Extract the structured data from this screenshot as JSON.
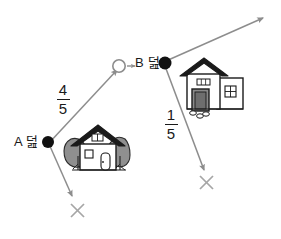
{
  "diagram": {
    "nodes": [
      {
        "id": "a",
        "label": "A 덢",
        "marker": "filled-dot"
      },
      {
        "id": "b",
        "label": "B 덢",
        "marker": "filled-dot"
      },
      {
        "id": "target",
        "label": "",
        "marker": "hollow-circle"
      }
    ],
    "fractions": [
      {
        "id": "left",
        "numerator": "4",
        "denominator": "5"
      },
      {
        "id": "right",
        "numerator": "1",
        "denominator": "5"
      }
    ],
    "marks": [
      {
        "id": "x-left",
        "glyph": "✕"
      },
      {
        "id": "x-right",
        "glyph": "✕"
      }
    ],
    "houses": [
      {
        "id": "house-left",
        "has_trees": true
      },
      {
        "id": "house-right",
        "has_trees": false
      }
    ],
    "colors": {
      "ink": "#1a1a1a",
      "arrow": "#8d8d8d",
      "roof": "#1a1a1a",
      "tree": "#8a8a8a",
      "door": "#6e6e6e",
      "wall": "#ffffff",
      "background": "#ffffff"
    }
  }
}
